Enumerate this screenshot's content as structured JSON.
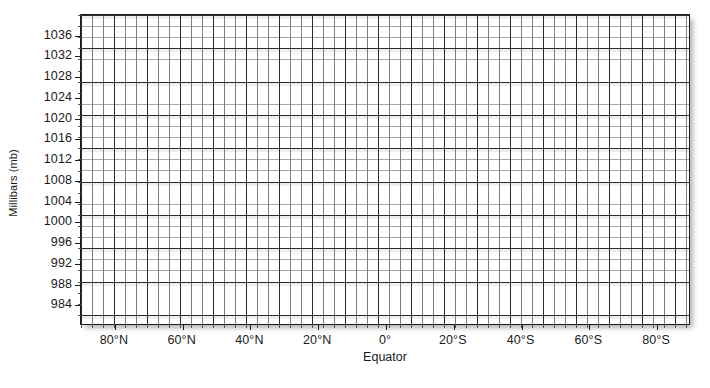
{
  "chart_data": {
    "type": "line",
    "title": "",
    "subtitle": "",
    "xlabel": "",
    "ylabel": "Millibars (mb)",
    "grid": true,
    "legend": null,
    "annotations": [
      "Equator"
    ],
    "series": [],
    "note": "Empty blank grid worksheet for plotting sea-level pressure versus latitude; no data plotted.",
    "x_axis": {
      "label": "",
      "tick_labels": [
        "80°N",
        "60°N",
        "40°N",
        "20°N",
        "0°",
        "20°S",
        "40°S",
        "60°S",
        "80°S"
      ],
      "tick_values": [
        80,
        60,
        40,
        20,
        0,
        -20,
        -40,
        -60,
        -80
      ],
      "sub_label": "Equator",
      "sub_label_at": 0,
      "xlim": [
        90,
        -90
      ],
      "minor_per_major": 3
    },
    "y_axis": {
      "label": "Millibars (mb)",
      "tick_labels": [
        "1036",
        "1032",
        "1028",
        "1024",
        "1020",
        "1016",
        "1012",
        "1008",
        "1004",
        "1000",
        "996",
        "992",
        "988",
        "984"
      ],
      "tick_values": [
        1036,
        1032,
        1028,
        1024,
        1020,
        1016,
        1012,
        1008,
        1004,
        1000,
        996,
        992,
        988,
        984
      ],
      "ylim": [
        1040,
        980
      ],
      "major_step": 4,
      "minor_per_major": 3
    },
    "colors": {
      "background": "#ffffff",
      "border": "#1c1c1c",
      "grid_major": "#2b2b2b",
      "grid_minor": "#a8a8a8",
      "text": "#1a1a1a"
    }
  }
}
